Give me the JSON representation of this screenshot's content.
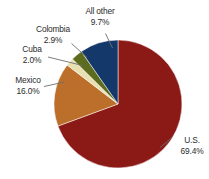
{
  "chart_data": {
    "type": "pie",
    "title": "",
    "subtitle": "",
    "xlabel": "",
    "ylabel": "",
    "legend_position": "none",
    "grid": false,
    "labels_outside": true,
    "units": "percent",
    "start_angle_deg": 0,
    "direction": "clockwise",
    "categories": [
      "U.S.",
      "Mexico",
      "Cuba",
      "Colombia",
      "All other"
    ],
    "values": [
      69.4,
      16.0,
      2.0,
      2.9,
      9.7
    ],
    "value_labels": [
      "69.4%",
      "16.0%",
      "2.0%",
      "2.9%",
      "9.7%"
    ],
    "colors": [
      "#8B1A16",
      "#BC6F2A",
      "#E8E0B0",
      "#5C6B1E",
      "#15386B"
    ],
    "slices": [
      {
        "name": "U.S.",
        "value": 69.4,
        "value_label": "69.4%",
        "color": "#8B1A16"
      },
      {
        "name": "Mexico",
        "value": 16.0,
        "value_label": "16.0%",
        "color": "#BC6F2A"
      },
      {
        "name": "Cuba",
        "value": 2.0,
        "value_label": "2.0%",
        "color": "#E8E0B0"
      },
      {
        "name": "Colombia",
        "value": 2.9,
        "value_label": "2.9%",
        "color": "#5C6B1E"
      },
      {
        "name": "All other",
        "value": 9.7,
        "value_label": "9.7%",
        "color": "#15386B"
      }
    ]
  },
  "labels": {
    "us": {
      "name": "U.S.",
      "pct": "69.4%"
    },
    "mexico": {
      "name": "Mexico",
      "pct": "16.0%"
    },
    "cuba": {
      "name": "Cuba",
      "pct": "2.0%"
    },
    "colombia": {
      "name": "Colombia",
      "pct": "2.9%"
    },
    "allother": {
      "name": "All other",
      "pct": "9.7%"
    }
  },
  "style": {
    "background": "#ffffff",
    "text_color": "#2b2b2b",
    "leader_line_color": "#6e6e6e"
  }
}
